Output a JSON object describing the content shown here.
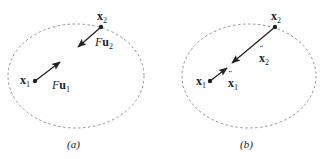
{
  "panels": [
    {
      "caption": "(a)",
      "points": [
        {
          "name": "x",
          "sub": "1"
        },
        {
          "name": "x",
          "sub": "2"
        }
      ],
      "vectors": [
        {
          "prefix": "F",
          "name": "u",
          "sub": "1"
        },
        {
          "prefix": "F",
          "name": "u",
          "sub": "2"
        }
      ]
    },
    {
      "caption": "(b)",
      "points": [
        {
          "name": "x",
          "sub": "1"
        },
        {
          "name": "x",
          "sub": "2"
        }
      ],
      "vectors": [
        {
          "accent": "¨",
          "name": "x",
          "sub": "1"
        },
        {
          "accent": "¨",
          "name": "x",
          "sub": "2"
        }
      ]
    }
  ],
  "colors": {
    "ink": "#222222",
    "dashed_boundary": "#777777"
  }
}
